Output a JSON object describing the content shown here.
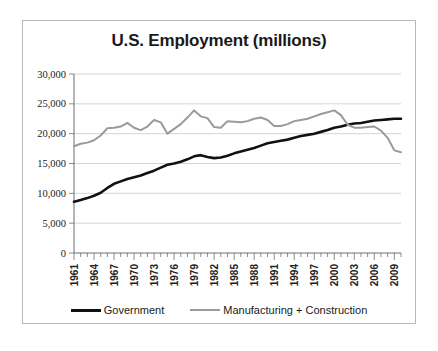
{
  "chart_data": {
    "type": "line",
    "title": "U.S. Employment (millions)",
    "xlabel": "",
    "ylabel": "",
    "ylim": [
      0,
      30000
    ],
    "ytick_labels": [
      "30,000",
      "25,000",
      "20,000",
      "15,000",
      "10,000",
      "5,000",
      "0"
    ],
    "ytick_values": [
      30000,
      25000,
      20000,
      15000,
      10000,
      5000,
      0
    ],
    "grid": true,
    "legend_position": "bottom",
    "x": [
      1961,
      1962,
      1963,
      1964,
      1965,
      1966,
      1967,
      1968,
      1969,
      1970,
      1971,
      1972,
      1973,
      1974,
      1975,
      1976,
      1977,
      1978,
      1979,
      1980,
      1981,
      1982,
      1983,
      1984,
      1985,
      1986,
      1987,
      1988,
      1989,
      1990,
      1991,
      1992,
      1993,
      1994,
      1995,
      1996,
      1997,
      1998,
      1999,
      2000,
      2001,
      2002,
      2003,
      2004,
      2005,
      2006,
      2007,
      2008,
      2009,
      2010
    ],
    "xtick_labels": [
      "1961",
      "1964",
      "1967",
      "1970",
      "1973",
      "1976",
      "1979",
      "1982",
      "1985",
      "1988",
      "1991",
      "1994",
      "1997",
      "2000",
      "2003",
      "2006",
      "2009"
    ],
    "series": [
      {
        "name": "Government",
        "color": "#111111",
        "values": [
          8600,
          8900,
          9200,
          9600,
          10100,
          10900,
          11600,
          12000,
          12400,
          12700,
          13000,
          13400,
          13800,
          14300,
          14800,
          15000,
          15300,
          15700,
          16200,
          16400,
          16100,
          15900,
          16000,
          16300,
          16700,
          17000,
          17300,
          17600,
          18000,
          18400,
          18600,
          18800,
          19000,
          19300,
          19600,
          19800,
          20000,
          20300,
          20600,
          21000,
          21200,
          21500,
          21700,
          21800,
          22000,
          22200,
          22300,
          22400,
          22500,
          22500
        ]
      },
      {
        "name": "Manufacturing + Construction",
        "color": "#9a9a9a",
        "values": [
          17900,
          18300,
          18500,
          18900,
          19700,
          20900,
          21000,
          21200,
          21800,
          21000,
          20600,
          21200,
          22300,
          21900,
          20000,
          20800,
          21600,
          22700,
          23900,
          22900,
          22600,
          21100,
          21000,
          22100,
          22000,
          21900,
          22100,
          22500,
          22700,
          22300,
          21300,
          21300,
          21600,
          22100,
          22300,
          22500,
          22900,
          23300,
          23600,
          23900,
          23100,
          21500,
          21000,
          21000,
          21100,
          21200,
          20500,
          19300,
          17200,
          16900
        ]
      }
    ]
  }
}
